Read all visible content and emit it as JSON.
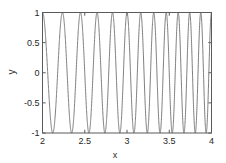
{
  "chart_data": {
    "type": "line",
    "title": "",
    "subtitle": "",
    "xlabel": "x",
    "ylabel": "y",
    "xlim": [
      2,
      4
    ],
    "ylim": [
      -1,
      1
    ],
    "xticks": [
      2,
      2.5,
      3,
      3.5,
      4
    ],
    "xticklabels": [
      "2",
      "2.5",
      "3",
      "3.5",
      "4"
    ],
    "yticks": [
      -1,
      -0.5,
      0,
      0.5,
      1
    ],
    "yticklabels": [
      "-1",
      "-0.5",
      "0",
      "0.5",
      "1"
    ],
    "grid": false,
    "legend": null,
    "legend_position": "none",
    "annotations": [],
    "series": [
      {
        "name": "chirp",
        "description": "cosine chirp with frequency increasing from left to right; amplitude 1, oscillating between -1 and 1",
        "color": "#6e6e6e",
        "linewidth": 0.9,
        "x": [
          2.0,
          2.02,
          2.04,
          2.06,
          2.08,
          2.1,
          2.12,
          2.14,
          2.16,
          2.18,
          2.2,
          2.22,
          2.24,
          2.26,
          2.28,
          2.3,
          2.32,
          2.34,
          2.36,
          2.38,
          2.4,
          2.42,
          2.44,
          2.46,
          2.48,
          2.5,
          2.52,
          2.54,
          2.56,
          2.58,
          2.6,
          2.62,
          2.64,
          2.66,
          2.68,
          2.7,
          2.72,
          2.74,
          2.76,
          2.78,
          2.8,
          2.82,
          2.84,
          2.86,
          2.88,
          2.9,
          2.92,
          2.94,
          2.96,
          2.98,
          3.0,
          3.02,
          3.04,
          3.06,
          3.08,
          3.1,
          3.12,
          3.14,
          3.16,
          3.18,
          3.2,
          3.22,
          3.24,
          3.26,
          3.28,
          3.3,
          3.32,
          3.34,
          3.36,
          3.38,
          3.4,
          3.42,
          3.44,
          3.46,
          3.48,
          3.5,
          3.52,
          3.54,
          3.56,
          3.58,
          3.6,
          3.62,
          3.64,
          3.66,
          3.68,
          3.7,
          3.72,
          3.74,
          3.76,
          3.78,
          3.8,
          3.82,
          3.84,
          3.86,
          3.88,
          3.9,
          3.92,
          3.94,
          3.96,
          3.98,
          4.0
        ],
        "peaks_x": [
          2.0,
          2.42,
          2.73,
          3.0,
          3.23,
          3.43,
          3.62,
          3.79,
          3.95
        ],
        "troughs_x": [
          2.22,
          2.59,
          2.87,
          3.12,
          3.34,
          3.53,
          3.71,
          3.87
        ],
        "npeaks": 9,
        "formula": "y = cos(2*pi*(x^2 - 4))"
      }
    ]
  },
  "axes": {
    "box_color": "#5a5a5a",
    "tick_color": "#5a5a5a",
    "background": "#ffffff"
  }
}
